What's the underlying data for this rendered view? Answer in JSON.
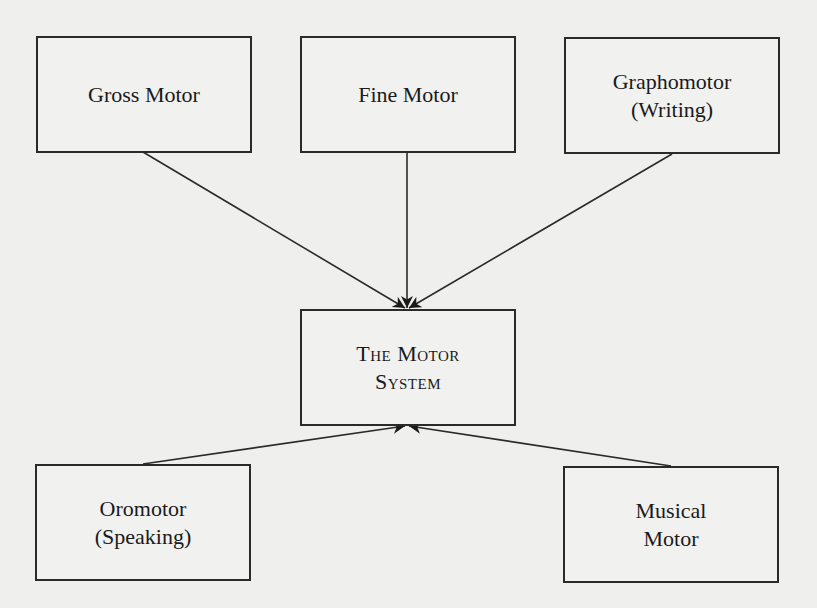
{
  "diagram": {
    "nodes": {
      "gross_motor": {
        "lines": [
          "Gross Motor"
        ]
      },
      "fine_motor": {
        "lines": [
          "Fine Motor"
        ]
      },
      "graphomotor": {
        "lines": [
          "Graphomotor",
          "(Writing)"
        ]
      },
      "motor_system": {
        "lines": [
          "The Motor",
          "System"
        ]
      },
      "oromotor": {
        "lines": [
          "Oromotor",
          "(Speaking)"
        ]
      },
      "musical_motor": {
        "lines": [
          "Musical",
          "Motor"
        ]
      }
    },
    "edges": [
      {
        "from": "Gross Motor",
        "to": "The Motor System"
      },
      {
        "from": "Fine Motor",
        "to": "The Motor System"
      },
      {
        "from": "Graphomotor (Writing)",
        "to": "The Motor System"
      },
      {
        "from": "Oromotor (Speaking)",
        "to": "The Motor System"
      },
      {
        "from": "Musical Motor",
        "to": "The Motor System"
      }
    ],
    "colors": {
      "line": "#2a2a2a",
      "background": "#efefed"
    }
  }
}
